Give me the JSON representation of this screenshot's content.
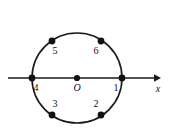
{
  "figure": {
    "background_color": "#ffffff",
    "stroke_color": "#1a1a1a",
    "point_color": "#111111",
    "width": 173,
    "height": 130
  },
  "chart_data": {
    "type": "scatter",
    "title": "",
    "xlabel": "x",
    "ylabel": "",
    "grid": false,
    "legend": null,
    "circle": {
      "center_x": 77,
      "center_y": 78,
      "radius": 45,
      "label": "circle"
    },
    "axis": {
      "name": "x-axis",
      "label": "x",
      "label_x": 158,
      "label_y": 89,
      "y": 78,
      "x_start": 8,
      "x_end": 158,
      "arrow": "right"
    },
    "origin": {
      "name": "O",
      "label": "O",
      "x": 77,
      "y": 78,
      "label_x": 77,
      "label_y": 91
    },
    "points": [
      {
        "label": "1",
        "x": 122,
        "y": 78,
        "label_x": 116,
        "label_y": 91,
        "angle_deg": 0
      },
      {
        "label": "2",
        "x": 101,
        "y": 115,
        "label_x": 96,
        "label_y": 107,
        "angle_deg": -55
      },
      {
        "label": "3",
        "x": 52,
        "y": 115,
        "label_x": 55,
        "label_y": 107,
        "angle_deg": -125
      },
      {
        "label": "4",
        "x": 32,
        "y": 78,
        "label_x": 36,
        "label_y": 91,
        "angle_deg": 180
      },
      {
        "label": "5",
        "x": 52,
        "y": 41,
        "label_x": 55,
        "label_y": 54,
        "angle_deg": 125
      },
      {
        "label": "6",
        "x": 101,
        "y": 41,
        "label_x": 96,
        "label_y": 54,
        "angle_deg": 55
      }
    ]
  }
}
